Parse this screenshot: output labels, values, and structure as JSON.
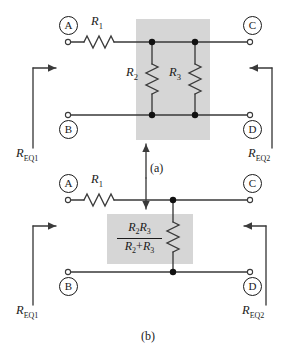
{
  "figure": {
    "background": "#ffffff",
    "shade_color": "#d4d4d4",
    "wire_color": "#3a3a3a",
    "ink_color": "#1a1a1a"
  },
  "circuit_a": {
    "part_label": "(a)",
    "nodes": [
      {
        "id": "A",
        "label": "A"
      },
      {
        "id": "B",
        "label": "B"
      },
      {
        "id": "C",
        "label": "C"
      },
      {
        "id": "D",
        "label": "D"
      }
    ],
    "components": [
      {
        "name": "series-resistor",
        "label_main": "R",
        "label_sub": "1"
      },
      {
        "name": "parallel-resistor-left",
        "label_main": "R",
        "label_sub": "2"
      },
      {
        "name": "parallel-resistor-right",
        "label_main": "R",
        "label_sub": "3"
      }
    ],
    "equivalent_labels": [
      {
        "name": "left",
        "main": "R",
        "sub": "EQ1"
      },
      {
        "name": "right",
        "main": "R",
        "sub": "EQ2"
      }
    ]
  },
  "circuit_b": {
    "part_label": "(b)",
    "nodes": [
      {
        "id": "A",
        "label": "A"
      },
      {
        "id": "B",
        "label": "B"
      },
      {
        "id": "C",
        "label": "C"
      },
      {
        "id": "D",
        "label": "D"
      }
    ],
    "components": [
      {
        "name": "series-resistor",
        "label_main": "R",
        "label_sub": "1"
      },
      {
        "name": "equivalent-parallel-resistor",
        "numerator_a_main": "R",
        "numerator_a_sub": "2",
        "numerator_b_main": "R",
        "numerator_b_sub": "3",
        "denominator_a_main": "R",
        "denominator_a_sub": "2",
        "denominator_plus": "+",
        "denominator_b_main": "R",
        "denominator_b_sub": "3"
      }
    ],
    "equivalent_labels": [
      {
        "name": "left",
        "main": "R",
        "sub": "EQ1"
      },
      {
        "name": "right",
        "main": "R",
        "sub": "EQ2"
      }
    ]
  }
}
